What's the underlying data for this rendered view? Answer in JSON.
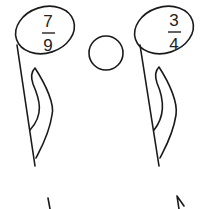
{
  "diagram": {
    "type": "fraction-comparison",
    "left_fraction": {
      "numerator": "7",
      "denominator": "9"
    },
    "right_fraction": {
      "numerator": "3",
      "denominator": "4"
    },
    "compare_circle": {
      "symbol": ""
    },
    "stroke_color": "#1a1a1a"
  }
}
